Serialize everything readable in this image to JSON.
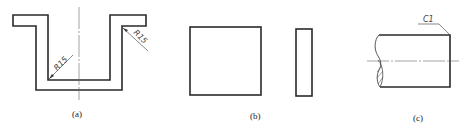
{
  "figure": {
    "panels": [
      {
        "id": "a",
        "caption": "(a)",
        "shape": "U-channel section with flanges",
        "annotations": [
          {
            "label": "R15",
            "position": "inner bottom-left corner"
          },
          {
            "label": "R15",
            "position": "outer top-right corner"
          }
        ]
      },
      {
        "id": "b",
        "caption": "(b)",
        "shape": "square plate and narrow rectangle side view"
      },
      {
        "id": "c",
        "caption": "(c)",
        "shape": "shaft end with break line",
        "annotations": [
          {
            "label": "C1",
            "position": "top-right chamfer"
          }
        ]
      }
    ]
  },
  "labels": {
    "a_caption": "(a)",
    "b_caption": "(b)",
    "c_caption": "(c)",
    "r15_left": "R15",
    "r15_right": "R15",
    "c1": "C1"
  },
  "colors": {
    "line": "#2a2a2a",
    "background": "#ffffff"
  }
}
